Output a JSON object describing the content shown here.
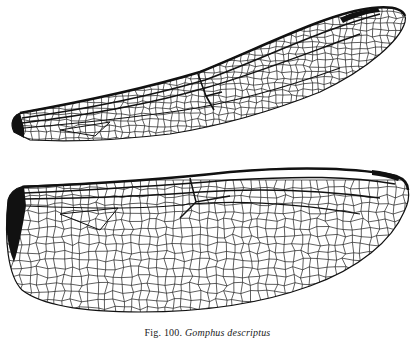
{
  "figure": {
    "caption": {
      "number": "Fig. 100.",
      "species": "Gomphus descriptus"
    },
    "colors": {
      "background": "#ffffff",
      "vein": "#111111"
    },
    "wings": [
      {
        "name": "forewing",
        "position": "top"
      },
      {
        "name": "hindwing",
        "position": "bottom"
      }
    ]
  }
}
